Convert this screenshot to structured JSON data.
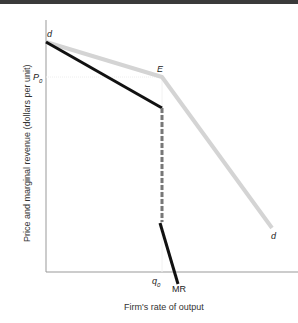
{
  "figure": {
    "y_axis_label": "Price and marginal revenue (dollars per unit)",
    "x_axis_label": "Firm's rate of output",
    "labels": {
      "d_top": "d",
      "d_bottom": "d",
      "kink": "E",
      "price": "P",
      "price_sub": "0",
      "quantity": "q",
      "quantity_sub": "0",
      "mr": "MR"
    },
    "colors": {
      "demand": "#d4d4d4",
      "mr": "#111111",
      "gap": "#777777",
      "axis": "#888888"
    }
  }
}
